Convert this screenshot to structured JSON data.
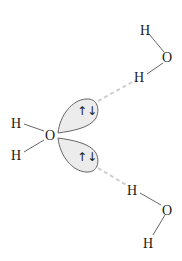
{
  "diagram": {
    "type": "hydrogen-bonding",
    "central_molecule": {
      "oxygen": "O",
      "hydrogens": [
        "H",
        "H"
      ],
      "lone_pairs": [
        {
          "label": "⇅",
          "electrons": "↑↓"
        },
        {
          "label": "⇅",
          "electrons": "↑↓"
        }
      ]
    },
    "donor_top": {
      "h_far": "H",
      "oxygen": "O",
      "h_bonded": "H"
    },
    "donor_bottom": {
      "h_bonded": "H",
      "oxygen": "O",
      "h_far": "H"
    },
    "colors": {
      "lobe_fill": "#ececec",
      "lobe_stroke": "#555555",
      "hbond_dash": "#cfcfcf",
      "text": "#1a1a1a"
    }
  }
}
